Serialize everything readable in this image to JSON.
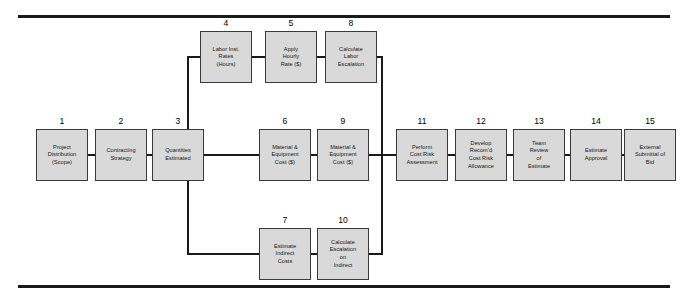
{
  "diagram": {
    "box_fill": "#d9d9d9",
    "box_border": "#3a3a3a",
    "line_color": "#1a1a1a",
    "nodes": [
      {
        "id": "n1",
        "num": "1",
        "label": "Project\nDistribution\n(Scope)",
        "x": 36,
        "y": 129
      },
      {
        "id": "n2",
        "num": "2",
        "label": "Contracting\nStrategy",
        "x": 95,
        "y": 129
      },
      {
        "id": "n3",
        "num": "3",
        "label": "Quantities\nEstimated",
        "x": 152,
        "y": 129
      },
      {
        "id": "n4",
        "num": "4",
        "label": "Labor Inst.\nRates\n(Hours)",
        "x": 200,
        "y": 31
      },
      {
        "id": "n5",
        "num": "5",
        "label": "Apply\nHourly\nRate ($)",
        "x": 265,
        "y": 31
      },
      {
        "id": "n8",
        "num": "8",
        "label": "Calculate\nLabor\nEscalation",
        "x": 325,
        "y": 31
      },
      {
        "id": "n6",
        "num": "6",
        "label": "Material &\nEquipment\nCost ($)",
        "x": 259,
        "y": 129
      },
      {
        "id": "n9",
        "num": "9",
        "label": "Material &\nEquipment\nCost ($)",
        "x": 317,
        "y": 129
      },
      {
        "id": "n11",
        "num": "11",
        "label": "Perform\nCost Risk\nAssessment",
        "x": 396,
        "y": 129
      },
      {
        "id": "n12",
        "num": "12",
        "label": "Develop\nRecom'd\nCost Risk\nAllowance",
        "x": 455,
        "y": 129
      },
      {
        "id": "n13",
        "num": "13",
        "label": "Team\nReview\nof\nEstimate",
        "x": 513,
        "y": 129
      },
      {
        "id": "n14",
        "num": "14",
        "label": "Estimate\nApproval",
        "x": 570,
        "y": 129
      },
      {
        "id": "n15",
        "num": "15",
        "label": "External\nSubmittal of\nBid",
        "x": 624,
        "y": 129
      },
      {
        "id": "n7",
        "num": "7",
        "label": "Estimate\nIndirect\nCosts",
        "x": 259,
        "y": 228
      },
      {
        "id": "n10",
        "num": "10",
        "label": "Calculate\nEscalation\non\nIndirect",
        "x": 317,
        "y": 228
      }
    ],
    "connectors": [
      {
        "id": "c1_2",
        "type": "h",
        "x": 88,
        "y": 154,
        "len": 7
      },
      {
        "id": "c2_3",
        "type": "h",
        "x": 147,
        "y": 154,
        "len": 5
      },
      {
        "id": "c3_bus",
        "type": "h",
        "x": 204,
        "y": 154,
        "len": 55
      },
      {
        "id": "c6_9",
        "type": "h",
        "x": 311,
        "y": 154,
        "len": 6
      },
      {
        "id": "c11_12",
        "type": "h",
        "x": 448,
        "y": 154,
        "len": 7
      },
      {
        "id": "c12_13",
        "type": "h",
        "x": 507,
        "y": 154,
        "len": 6
      },
      {
        "id": "c13_14",
        "type": "h",
        "x": 565,
        "y": 154,
        "len": 5
      },
      {
        "id": "c14_15",
        "type": "h",
        "x": 622,
        "y": 154,
        "len": 2
      },
      {
        "id": "c4_5",
        "type": "h",
        "x": 252,
        "y": 56,
        "len": 13
      },
      {
        "id": "c5_8",
        "type": "h",
        "x": 317,
        "y": 56,
        "len": 8
      },
      {
        "id": "c7_10",
        "type": "h",
        "x": 311,
        "y": 253,
        "len": 6
      },
      {
        "id": "cbr_v",
        "type": "v",
        "x": 187,
        "y": 56,
        "len": 99
      },
      {
        "id": "cbr_t",
        "type": "h",
        "x": 187,
        "y": 56,
        "len": 13
      },
      {
        "id": "cbr_b",
        "type": "h",
        "x": 152,
        "y": 154,
        "len": 37
      },
      {
        "id": "cbr_d",
        "type": "v",
        "x": 187,
        "y": 154,
        "len": 99
      },
      {
        "id": "cbr_db",
        "type": "h",
        "x": 187,
        "y": 253,
        "len": 72
      },
      {
        "id": "cmg_v",
        "type": "v",
        "x": 381,
        "y": 56,
        "len": 199
      },
      {
        "id": "cmg_t",
        "type": "h",
        "x": 377,
        "y": 56,
        "len": 6
      },
      {
        "id": "cmg_m",
        "type": "h",
        "x": 369,
        "y": 154,
        "len": 27
      },
      {
        "id": "cmg_b",
        "type": "h",
        "x": 369,
        "y": 253,
        "len": 14
      }
    ]
  }
}
